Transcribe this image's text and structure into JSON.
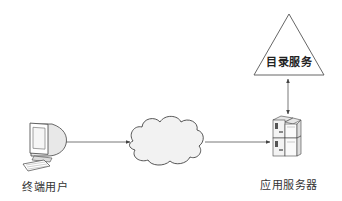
{
  "diagram": {
    "type": "network-architecture",
    "nodes": [
      {
        "id": "terminal-user",
        "label": "终端用户",
        "icon": "desktop-computer-icon"
      },
      {
        "id": "network",
        "label": "",
        "icon": "cloud-icon"
      },
      {
        "id": "app-server",
        "label": "应用服务器",
        "icon": "server-stack-icon"
      },
      {
        "id": "directory-service",
        "label": "目录服务",
        "icon": "triangle-shape"
      }
    ],
    "edges": [
      {
        "from": "terminal-user",
        "to": "network",
        "arrow": "end"
      },
      {
        "from": "network",
        "to": "app-server",
        "arrow": "end"
      },
      {
        "from": "app-server",
        "to": "directory-service",
        "arrow": "both"
      }
    ]
  },
  "colors": {
    "line": "#555555",
    "cloud_fill": "#f2f2f2",
    "triangle_fill": "#ffffff",
    "text": "#333333"
  }
}
